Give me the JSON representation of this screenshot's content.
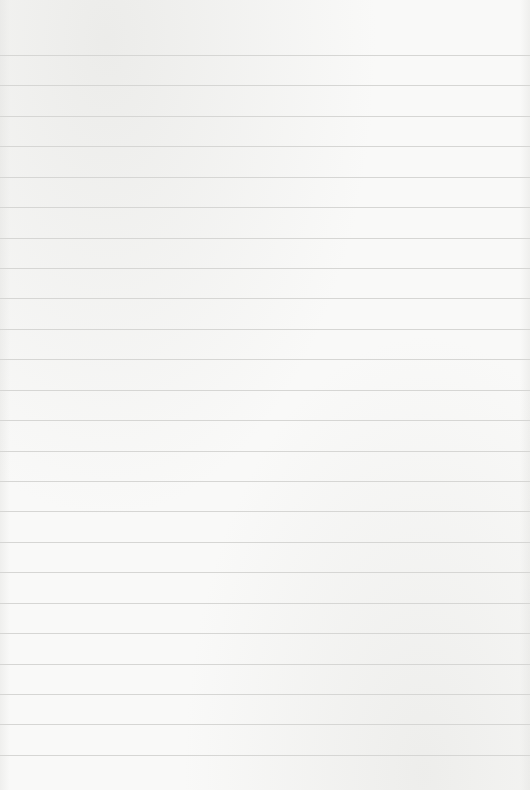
{
  "paper": {
    "background_color": "#f9f9f8",
    "line_color": "#d6d6d4",
    "first_line_y": 55,
    "line_spacing": 30.43,
    "line_count": 24
  }
}
